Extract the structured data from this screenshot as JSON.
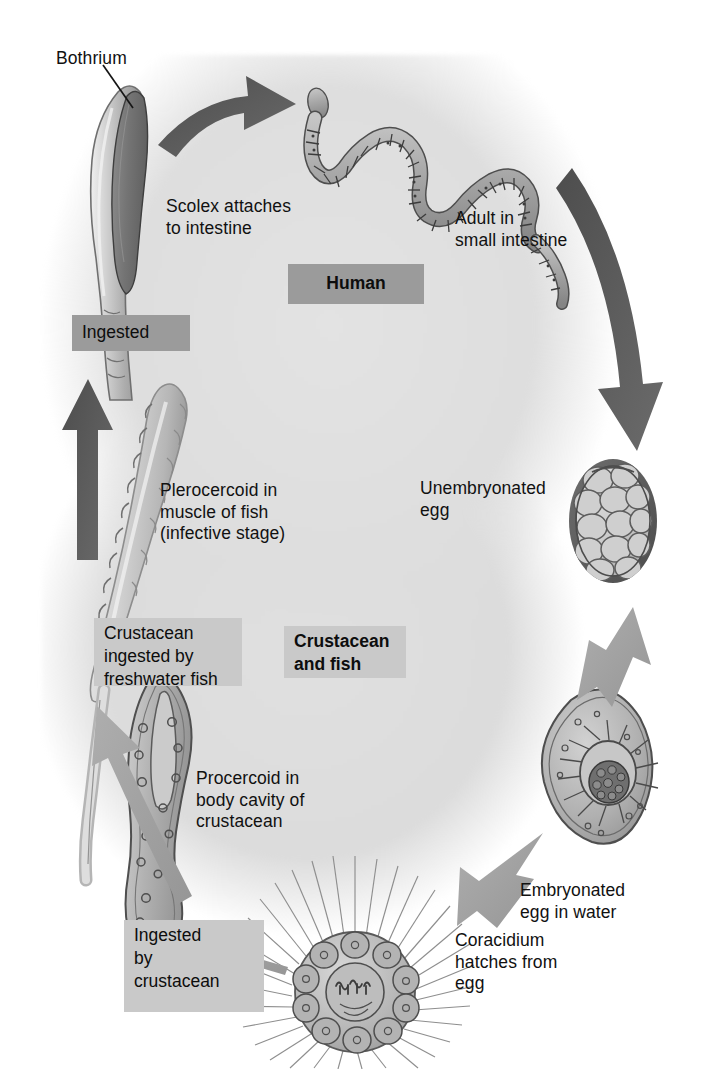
{
  "diagram": {
    "type": "life-cycle",
    "figure_caption": "",
    "host_bands": [
      {
        "id": "human",
        "label": "Human",
        "style": "dark",
        "bold": true
      },
      {
        "id": "crustacean-and-fish",
        "label": "Crustacean\nand fish",
        "style": "light",
        "bold": true
      }
    ],
    "stage_labels": [
      {
        "id": "bothrium",
        "label": "Bothrium",
        "boxed": false
      },
      {
        "id": "scolex-attaches",
        "label": "Scolex attaches\nto intestine",
        "boxed": false
      },
      {
        "id": "adult-in-intestine",
        "label": "Adult in\nsmall intestine",
        "boxed": false
      },
      {
        "id": "ingested-top",
        "label": "Ingested",
        "boxed": true,
        "style": "dark"
      },
      {
        "id": "plerocercoid",
        "label": "Plerocercoid in\nmuscle of fish\n(infective stage)",
        "boxed": false
      },
      {
        "id": "unembryonated-egg",
        "label": "Unembryonated\negg",
        "boxed": false
      },
      {
        "id": "crustacean-ingested",
        "label": "Crustacean\ningested by\nfreshwater fish",
        "boxed": true,
        "style": "light"
      },
      {
        "id": "procercoid",
        "label": "Procercoid in\nbody cavity of\ncrustacean",
        "boxed": false
      },
      {
        "id": "embryonated-egg",
        "label": "Embryonated\negg in water",
        "boxed": false
      },
      {
        "id": "coracidium",
        "label": "Coracidium\nhatches from\negg",
        "boxed": false
      },
      {
        "id": "ingested-by-crustacean",
        "label": "Ingested\nby\ncrustacean",
        "boxed": true,
        "style": "light"
      }
    ],
    "organisms": [
      {
        "id": "scolex",
        "name": "tapeworm-scolex-with-bothrium"
      },
      {
        "id": "adult-tapeworm",
        "name": "adult-segmented-tapeworm"
      },
      {
        "id": "unembryonated-egg",
        "name": "unembryonated-egg"
      },
      {
        "id": "embryonated-egg",
        "name": "embryonated-egg-with-oncosphere"
      },
      {
        "id": "coracidium",
        "name": "ciliated-coracidium"
      },
      {
        "id": "procercoid",
        "name": "procercoid-larva"
      },
      {
        "id": "plerocercoid",
        "name": "plerocercoid-larva"
      }
    ],
    "arrows": [
      {
        "id": "scolex-to-adult",
        "from": "scolex",
        "to": "adult-tapeworm",
        "tone": "dark"
      },
      {
        "id": "adult-to-unembryonated-egg",
        "from": "adult-tapeworm",
        "to": "unembryonated-egg",
        "tone": "dark"
      },
      {
        "id": "egg-to-embryonated-egg",
        "from": "unembryonated-egg",
        "to": "embryonated-egg",
        "tone": "light"
      },
      {
        "id": "embryonated-egg-to-coracidium",
        "from": "embryonated-egg",
        "to": "coracidium",
        "tone": "light"
      },
      {
        "id": "coracidium-to-procercoid",
        "from": "coracidium",
        "to": "procercoid",
        "tone": "light"
      },
      {
        "id": "procercoid-to-plerocercoid",
        "from": "procercoid",
        "to": "plerocercoid",
        "tone": "light"
      },
      {
        "id": "plerocercoid-to-human",
        "from": "plerocercoid",
        "to": "scolex",
        "tone": "dark"
      }
    ],
    "colors": {
      "background": "#ffffff",
      "cycle_field": "#e0e0e0",
      "band_dark": "#9b9b9b",
      "band_light": "#c9c9c9",
      "arrow_dark": "#575757",
      "arrow_light": "#a6a6a6",
      "organism_fill": "#b8b8b8",
      "organism_outline": "#4a4a4a",
      "text": "#111111"
    }
  }
}
